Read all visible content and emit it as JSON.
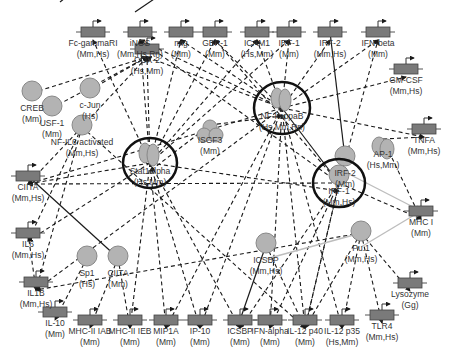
{
  "diagram": {
    "title": "",
    "gene_nodes": [
      {
        "id": "cox2",
        "name": "COX-2",
        "species": "(Hs,Mm)",
        "x": 147,
        "y": 49
      },
      {
        "id": "fcgri",
        "name": "Fc-gammaRI",
        "species": "(Mm,Hs)",
        "x": 93,
        "y": 32
      },
      {
        "id": "inos",
        "name": "iNOS",
        "species": "(Mm,Hs,Rn)",
        "x": 140,
        "y": 32
      },
      {
        "id": "mig",
        "name": "mig",
        "species": "(Mm)",
        "x": 181,
        "y": 32
      },
      {
        "id": "gbp1",
        "name": "GBP-1",
        "species": "(Mm)",
        "x": 215,
        "y": 32
      },
      {
        "id": "icam1",
        "name": "ICAM1",
        "species": "(Hs,Mm)",
        "x": 257,
        "y": 32
      },
      {
        "id": "irf1t",
        "name": "IRF-1",
        "species": "(Mm)",
        "x": 289,
        "y": 32
      },
      {
        "id": "irf2t",
        "name": "IRF-2",
        "species": "(Mm,Hs)",
        "x": 330,
        "y": 32
      },
      {
        "id": "ifnb",
        "name": "IFN-beta",
        "species": "(Mm)",
        "x": 378,
        "y": 32
      },
      {
        "id": "gmcsf",
        "name": "GM-CSF",
        "species": "(Mm,Hs)",
        "x": 406,
        "y": 69
      },
      {
        "id": "tnfa",
        "name": "TNFA",
        "species": "(Mm,Hs)",
        "x": 424,
        "y": 129
      },
      {
        "id": "ciita1",
        "name": "CIITA",
        "species": "(Mm,Hs)",
        "x": 28,
        "y": 176
      },
      {
        "id": "mhc1",
        "name": "MHC I",
        "species": "(Mm)",
        "x": 421,
        "y": 211
      },
      {
        "id": "il6",
        "name": "IL6",
        "species": "(Mm,Hs)",
        "x": 28,
        "y": 233
      },
      {
        "id": "il1b",
        "name": "IL1B",
        "species": "(Mm,Hs)",
        "x": 36,
        "y": 282
      },
      {
        "id": "il10",
        "name": "IL-10",
        "species": "(Mm)",
        "x": 55,
        "y": 312
      },
      {
        "id": "mhc2iab",
        "name": "MHC-II IAB",
        "species": "(Mm)",
        "x": 90,
        "y": 320
      },
      {
        "id": "mhc2ieb",
        "name": "MHC-II IEB",
        "species": "(Mm)",
        "x": 130,
        "y": 320
      },
      {
        "id": "mip1a",
        "name": "MIP1A",
        "species": "(Mm)",
        "x": 166,
        "y": 320
      },
      {
        "id": "ip10",
        "name": "IP-10",
        "species": "(Mm)",
        "x": 200,
        "y": 320
      },
      {
        "id": "icsbpt",
        "name": "ICSBP",
        "species": "(Mm)",
        "x": 240,
        "y": 320
      },
      {
        "id": "ifna",
        "name": "IFN-alpha",
        "species": "(Mm)",
        "x": 270,
        "y": 320
      },
      {
        "id": "il12p40",
        "name": "IL-12 p40",
        "species": "(Mm)",
        "x": 305,
        "y": 320
      },
      {
        "id": "il12p35",
        "name": "IL-12 p35",
        "species": "(Hs,Mm)",
        "x": 342,
        "y": 320
      },
      {
        "id": "tlr4",
        "name": "TLR4",
        "species": "(Mm,Hs)",
        "x": 382,
        "y": 315
      },
      {
        "id": "lysozyme",
        "name": "Lysozyme",
        "species": "(Gg)",
        "x": 410,
        "y": 283
      }
    ],
    "protein_nodes": [
      {
        "id": "creb",
        "name": "CREB",
        "species": "(Mm)",
        "x": 32,
        "y": 103,
        "type": "single"
      },
      {
        "id": "cjun",
        "name": "c-Jun",
        "species": "(Hs)",
        "x": 90,
        "y": 100,
        "type": "single"
      },
      {
        "id": "usf1",
        "name": "USF-1",
        "species": "(Mm)",
        "x": 52,
        "y": 118,
        "type": "single"
      },
      {
        "id": "nfil6",
        "name": "NF-IL6 activated",
        "species": "(Mm,Hs)",
        "x": 82,
        "y": 137,
        "type": "single"
      },
      {
        "id": "isgf3",
        "name": "ISGF3",
        "species": "(Mm)",
        "x": 210,
        "y": 135,
        "type": "trimer"
      },
      {
        "id": "ap1",
        "name": "AP-1",
        "species": "(Hs,Mm)",
        "x": 383,
        "y": 149,
        "type": "dimer"
      },
      {
        "id": "irf2",
        "name": "IRF-2",
        "species": "(Mm)",
        "x": 345,
        "y": 168,
        "type": "single"
      },
      {
        "id": "sp1",
        "name": "Sp1",
        "species": "(Hs)",
        "x": 87,
        "y": 268,
        "type": "single"
      },
      {
        "id": "ciita2",
        "name": "CIITA",
        "species": "(Mm)",
        "x": 118,
        "y": 268,
        "type": "single"
      },
      {
        "id": "icsbp",
        "name": "ICSBP",
        "species": "(Mm,Hs)",
        "x": 266,
        "y": 255,
        "type": "single"
      },
      {
        "id": "pu1",
        "name": "Pu.1",
        "species": "(Mm,Hs)",
        "x": 361,
        "y": 243,
        "type": "single"
      }
    ],
    "hub_nodes": [
      {
        "id": "stat1",
        "name": "Stat1alpha",
        "species": "(Hs,Mm)",
        "x": 150,
        "y": 163,
        "r": 27,
        "type": "dimer"
      },
      {
        "id": "nfkb",
        "name": "NF-kappaB",
        "species": "(Hs,Mm,Rn)",
        "x": 282,
        "y": 108,
        "r": 28,
        "type": "dimer"
      },
      {
        "id": "irf1",
        "name": "IRF-1",
        "species": "(Mm,Hs)",
        "x": 339,
        "y": 183,
        "r": 26,
        "type": "single"
      }
    ],
    "colors": {
      "node_fill": "#b3b3b3",
      "gene_fill": "#7a7a7a",
      "edge": "#1a1a1a",
      "hub_ring": "#111111",
      "grey_edge": "#bdbdbd",
      "label": "#333333"
    }
  }
}
